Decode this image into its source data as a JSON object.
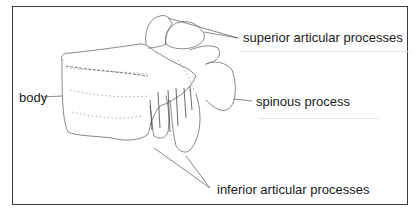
{
  "figure": {
    "labels": {
      "superior": "superior articular processes",
      "body": "body",
      "spinous": "spinous process",
      "inferior": "inferior articular processes"
    }
  },
  "colors": {
    "line": "#6a6a6a",
    "text": "#1a1a1a",
    "frame": "#3a3a3a"
  }
}
